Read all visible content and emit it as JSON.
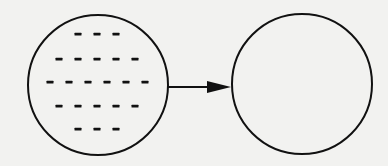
{
  "diagram": {
    "background": "#f2f2f0",
    "stroke_color": "#111111",
    "nodes": [
      {
        "id": "source-circle",
        "shape": "circle",
        "cx": 98,
        "cy": 85,
        "r": 70,
        "fill": "none",
        "content": "dashes",
        "dash_rows": [
          {
            "y": 34,
            "xs": [
              78,
              97,
              116
            ]
          },
          {
            "y": 59,
            "xs": [
              59,
              78,
              97,
              116,
              135
            ]
          },
          {
            "y": 82,
            "xs": [
              50,
              69,
              88,
              107,
              126,
              145
            ]
          },
          {
            "y": 106,
            "xs": [
              59,
              78,
              97,
              116,
              135
            ]
          },
          {
            "y": 129,
            "xs": [
              78,
              97,
              116
            ]
          }
        ],
        "dash_counts": [
          3,
          5,
          6,
          5,
          3
        ]
      },
      {
        "id": "target-circle",
        "shape": "circle",
        "cx": 302,
        "cy": 84,
        "r": 70,
        "fill": "none",
        "content": "empty"
      }
    ],
    "edges": [
      {
        "from": "source-circle",
        "to": "target-circle",
        "x1": 168,
        "y1": 87,
        "x2": 231,
        "y2": 87,
        "arrowhead": "filled-triangle"
      }
    ]
  }
}
